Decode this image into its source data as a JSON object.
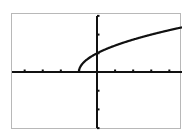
{
  "chart_data": {
    "type": "line",
    "title": "",
    "xlabel": "",
    "ylabel": "",
    "function": "y = sqrt(x + 1)",
    "xlim": [
      -4.7,
      4.7
    ],
    "ylim": [
      -3.1,
      3.1
    ],
    "x_ticks": [
      -4,
      -3,
      -2,
      -1,
      1,
      2,
      3,
      4
    ],
    "y_ticks": [
      -3,
      -2,
      -1,
      1,
      2,
      3
    ],
    "grid": false,
    "legend": null,
    "series": [
      {
        "name": "sqrt(x+1)",
        "x": [
          -1,
          -0.75,
          -0.5,
          0,
          0.5,
          1,
          1.5,
          2,
          2.5,
          3,
          3.5,
          4,
          4.5,
          4.7
        ],
        "values": [
          0,
          0.5,
          0.707,
          1,
          1.225,
          1.414,
          1.581,
          1.732,
          1.871,
          2,
          2.121,
          2.236,
          2.345,
          2.387
        ]
      }
    ],
    "colors": {
      "curve": "#111111",
      "axes": "#111111",
      "frame": "#b8b8b8",
      "background": "#ffffff"
    }
  }
}
